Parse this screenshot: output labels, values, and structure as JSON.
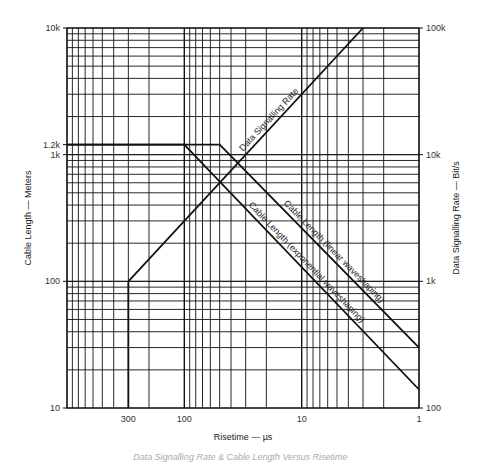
{
  "chart_data": {
    "type": "line",
    "title": "",
    "caption": "Data Signalling Rate & Cable Length Versus Risetime",
    "xlabel": "Risetime — µs",
    "ylabel_left": "Cable Length — Meters",
    "ylabel_right": "Data Signalling Rate — Bit/s",
    "x_scale": "log",
    "x_reversed": true,
    "xlim": [
      1000,
      1
    ],
    "x_ticks": [
      {
        "value": 300,
        "label": "300"
      },
      {
        "value": 100,
        "label": "100"
      },
      {
        "value": 10,
        "label": "10"
      },
      {
        "value": 1,
        "label": "1"
      }
    ],
    "y_left_scale": "log",
    "ylim_left": [
      10,
      10000
    ],
    "y_left_ticks": [
      {
        "value": 10,
        "label": "10"
      },
      {
        "value": 100,
        "label": "100"
      },
      {
        "value": 1000,
        "label": "1k"
      },
      {
        "value": 1200,
        "label": "1.2k"
      },
      {
        "value": 10000,
        "label": "10k"
      }
    ],
    "y_right_scale": "log",
    "ylim_right": [
      100,
      100000
    ],
    "y_right_ticks": [
      {
        "value": 100,
        "label": "100"
      },
      {
        "value": 1000,
        "label": "1k"
      },
      {
        "value": 10000,
        "label": "10k"
      },
      {
        "value": 100000,
        "label": "100k"
      }
    ],
    "grid": true,
    "series": [
      {
        "name": "Data Signalling Rate",
        "axis": "right",
        "x": [
          300,
          3
        ],
        "y": [
          1000,
          100000
        ]
      },
      {
        "name": "Cable Length (linear waveshaping)",
        "axis": "left",
        "x": [
          1000,
          50,
          1
        ],
        "y": [
          1200,
          1200,
          30
        ]
      },
      {
        "name": "Cable Length (exponential waveshaping)",
        "axis": "left",
        "x": [
          1000,
          100,
          1
        ],
        "y": [
          1200,
          1200,
          14
        ]
      }
    ]
  }
}
